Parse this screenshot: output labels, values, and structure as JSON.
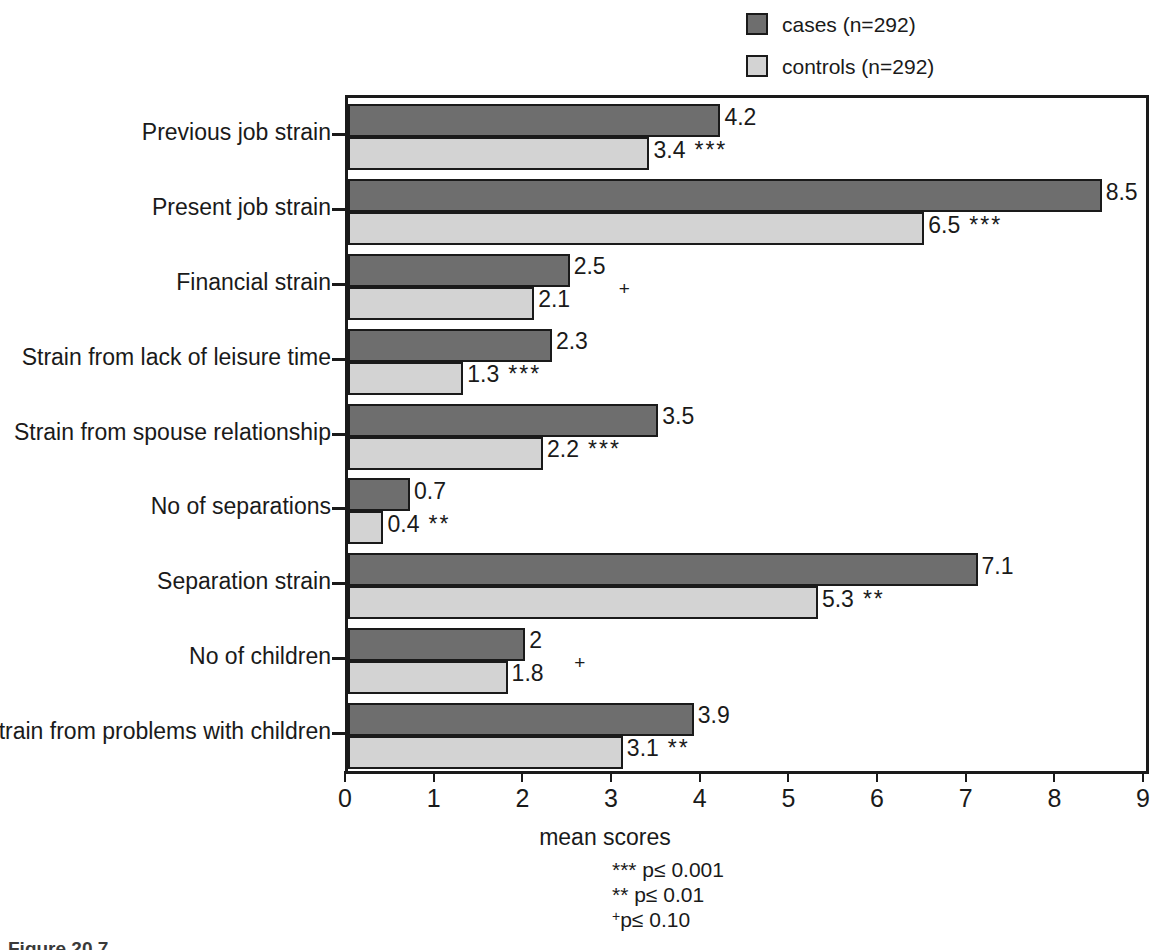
{
  "legend": {
    "items": [
      {
        "label": "cases (n=292)",
        "color": "#6e6e6e",
        "swatch_name": "legend-swatch-cases"
      },
      {
        "label": "controls (n=292)",
        "color": "#d3d3d3",
        "swatch_name": "legend-swatch-controls"
      }
    ]
  },
  "axis": {
    "x_title": "mean scores",
    "x_ticks": [
      "0",
      "1",
      "2",
      "3",
      "4",
      "5",
      "6",
      "7",
      "8",
      "9"
    ]
  },
  "footnotes": {
    "line1": "*** p≤ 0.001",
    "line2": "** p≤ 0.01",
    "line3_sup": "+",
    "line3": "p≤ 0.10"
  },
  "caption": "Figure 20.7",
  "chart_data": {
    "type": "bar",
    "orientation": "horizontal",
    "title": "",
    "subtitle": "",
    "xlabel": "mean scores",
    "ylabel": "",
    "xlim": [
      0,
      9
    ],
    "xticks": [
      0,
      1,
      2,
      3,
      4,
      5,
      6,
      7,
      8,
      9
    ],
    "grid": false,
    "legend_position": "top-right",
    "categories": [
      "Previous job strain",
      "Present job strain",
      "Financial strain",
      "Strain from lack of leisure time",
      "Strain from spouse relationship",
      "No of separations",
      "Separation strain",
      "No of children",
      "Strain from problems with children"
    ],
    "series": [
      {
        "name": "cases (n=292)",
        "color": "#6e6e6e",
        "values": [
          4.2,
          8.5,
          2.5,
          2.3,
          3.5,
          0.7,
          7.1,
          2,
          3.9
        ],
        "labels": [
          "4.2",
          "8.5",
          "2.5",
          "2.3",
          "3.5",
          "0.7",
          "7.1",
          "2",
          "3.9"
        ]
      },
      {
        "name": "controls (n=292)",
        "color": "#d3d3d3",
        "values": [
          3.4,
          6.5,
          2.1,
          1.3,
          2.2,
          0.4,
          5.3,
          1.8,
          3.1
        ],
        "labels": [
          "3.4",
          "6.5",
          "2.1",
          "1.3",
          "2.2",
          "0.4",
          "5.3",
          "1.8",
          "3.1"
        ],
        "significance": [
          "***",
          "***",
          "+",
          "***",
          "***",
          "**",
          "**",
          "+",
          "**"
        ]
      }
    ],
    "significance_legend": {
      "***": "p≤ 0.001",
      "**": "p≤ 0.01",
      "+": "p≤ 0.10"
    }
  }
}
